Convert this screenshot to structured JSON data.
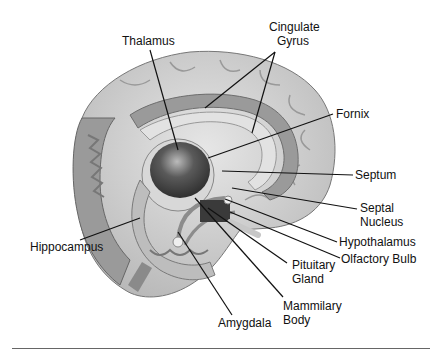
{
  "diagram": {
    "labels": {
      "thalamus": "Thalamus",
      "cingulate_gyrus_1": "Cingulate",
      "cingulate_gyrus_2": "Gyrus",
      "fornix": "Fornix",
      "septum": "Septum",
      "septal_nucleus_1": "Septal",
      "septal_nucleus_2": "Nucleus",
      "hypothalamus": "Hypothalamus",
      "olfactory_bulb": "Olfactory Bulb",
      "pituitary_gland_1": "Pituitary",
      "pituitary_gland_2": "Gland",
      "mammilary_body_1": "Mammilary",
      "mammilary_body_2": "Body",
      "amygdala": "Amygdala",
      "hippocampus": "Hippocampus"
    },
    "colors": {
      "cortex": "#cfcfcf",
      "cortex_dark": "#8a8a8a",
      "cingulate": "#9a9a9a",
      "thalamus": "#4a4a4a",
      "leader_line": "#111111"
    }
  }
}
